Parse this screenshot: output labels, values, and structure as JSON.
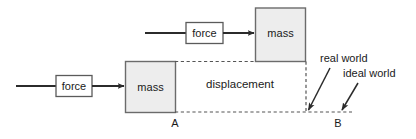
{
  "diagram": {
    "colors": {
      "stroke": "#2b2b2b",
      "box_fill": "#ededed",
      "box_stroke": "#6b6b6b",
      "dashed_stroke": "#555555",
      "text": "#1a1a1a",
      "background": "#ffffff"
    },
    "upper_system": {
      "force_box_label": "force",
      "mass_box_label": "mass"
    },
    "lower_system": {
      "force_box_label": "force",
      "mass_box_label": "mass"
    },
    "displacement_label": "displacement",
    "point_labels": {
      "start": "A",
      "end": "B"
    },
    "annotations": [
      {
        "label": "real world"
      },
      {
        "label": "ideal world"
      }
    ]
  }
}
